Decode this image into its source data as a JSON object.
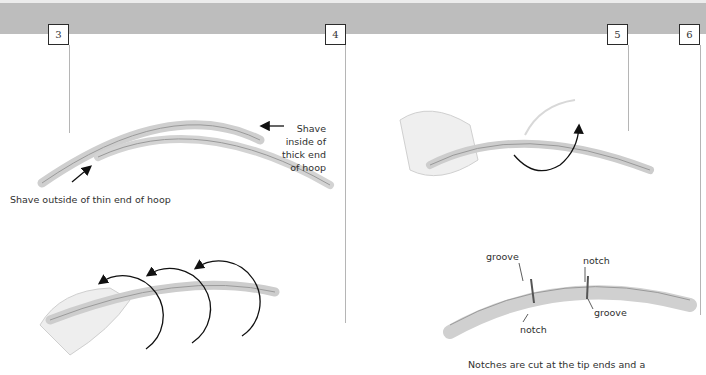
{
  "header": {
    "band_color": "#bdbdbd",
    "steps": [
      {
        "number": "3"
      },
      {
        "number": "4"
      },
      {
        "number": "5"
      },
      {
        "number": "6"
      }
    ]
  },
  "illustrations": {
    "step3_top": {
      "callout_thick_end": [
        "Shave",
        "inside of",
        "thick end",
        "of hoop"
      ],
      "callout_thin_end": "Shave outside of thin end of hoop"
    },
    "step3_bottom": {
      "description": "hand wrapping tips around hoop with three circular arrows"
    },
    "step5_top": {
      "description": "hand wrapping tip around hoop with one circular arrow"
    },
    "step5_bottom": {
      "labels": {
        "groove_left": "groove",
        "notch_top": "notch",
        "notch_bottom": "notch",
        "groove_right": "groove"
      },
      "caption": "Notches are cut at the tip ends and a"
    }
  }
}
